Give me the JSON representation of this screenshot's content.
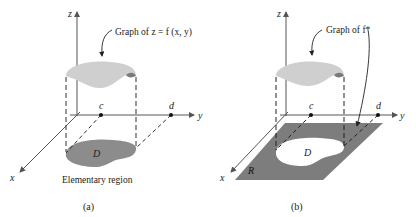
{
  "panel_a": {
    "axes": {
      "x": "x",
      "y": "y",
      "z": "z"
    },
    "points": {
      "c": "c",
      "d": "d"
    },
    "callout": "Graph of z = f (x, y)",
    "region_label": "D",
    "caption": "Elementary region",
    "panel_label": "(a)"
  },
  "panel_b": {
    "axes": {
      "x": "x",
      "y": "y",
      "z": "z"
    },
    "points": {
      "c": "c",
      "d": "d"
    },
    "callout": "Graph of f*",
    "region_label": "D",
    "rect_label": "R",
    "panel_label": "(b)"
  },
  "colors": {
    "surface": "#cfcfcf",
    "surface_dark": "#7a7a7a",
    "region": "#8c8c8c",
    "rect": "#7d7d7d",
    "axis": "#555555"
  }
}
